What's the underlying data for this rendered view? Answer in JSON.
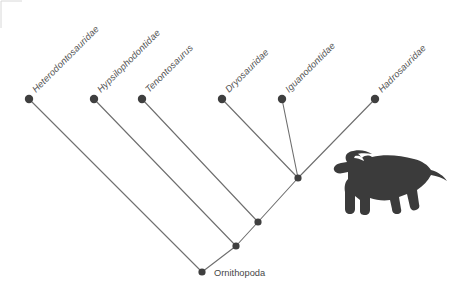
{
  "figure": {
    "background_color": "#ffffff",
    "line_color": "#6e6e6e",
    "node_color": "#3f3f3f",
    "label_color": "#555555",
    "silhouette_color": "#3b3b3b",
    "label_rotation_degrees": -45
  },
  "chart_data": {
    "type": "diagram",
    "diagram_kind": "cladogram",
    "title": "Ornithopoda",
    "root_label": "Ornithopoda",
    "tips": [
      {
        "id": "heterodontosauridae",
        "label": "Heterodontosauridae",
        "italic": true,
        "x": 29,
        "y": 99
      },
      {
        "id": "hypsilophodontidae",
        "label": "Hypsilophodontidae",
        "italic": true,
        "x": 94,
        "y": 99
      },
      {
        "id": "tenontosaurus",
        "label": "Tenontosaurus",
        "italic": true,
        "x": 142,
        "y": 99
      },
      {
        "id": "dryosauridae",
        "label": "Dryosauridae",
        "italic": true,
        "x": 222,
        "y": 99
      },
      {
        "id": "iguanodontidae",
        "label": "Iguanodontidae",
        "italic": true,
        "x": 282,
        "y": 99
      },
      {
        "id": "hadrosauridae",
        "label": "Hadrosauridae",
        "italic": true,
        "x": 375,
        "y": 99
      }
    ],
    "internal_nodes": [
      {
        "id": "node-root",
        "label": "Ornithopoda",
        "x": 202,
        "y": 272
      },
      {
        "id": "node-clade-2",
        "label": "",
        "x": 236,
        "y": 246
      },
      {
        "id": "node-clade-3",
        "label": "",
        "x": 258,
        "y": 222
      },
      {
        "id": "node-iguanodontia",
        "label": "",
        "x": 298,
        "y": 178
      }
    ],
    "edges": [
      {
        "from": "node-root",
        "to": "heterodontosauridae"
      },
      {
        "from": "node-root",
        "to": "node-clade-2"
      },
      {
        "from": "node-clade-2",
        "to": "hypsilophodontidae"
      },
      {
        "from": "node-clade-2",
        "to": "node-clade-3"
      },
      {
        "from": "node-clade-3",
        "to": "tenontosaurus"
      },
      {
        "from": "node-clade-3",
        "to": "node-iguanodontia"
      },
      {
        "from": "node-iguanodontia",
        "to": "dryosauridae"
      },
      {
        "from": "node-iguanodontia",
        "to": "iguanodontidae"
      },
      {
        "from": "node-iguanodontia",
        "to": "hadrosauridae"
      }
    ]
  },
  "silhouette": {
    "name": "hadrosaur-silhouette",
    "description": "Parasaurolophus-like hadrosaur silhouette",
    "x": 333,
    "y": 152,
    "width": 114,
    "height": 63
  }
}
